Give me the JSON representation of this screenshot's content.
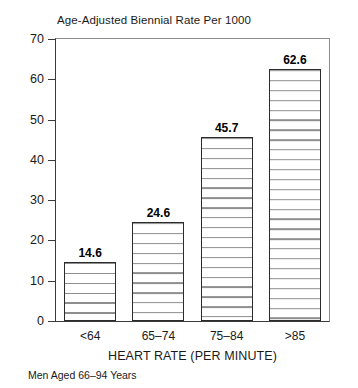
{
  "chart_data": {
    "type": "bar",
    "title": "Age-Adjusted Biennial Rate Per 1000",
    "xlabel": "HEART RATE (PER MINUTE)",
    "ylabel": "",
    "footnote": "Men Aged 66–94 Years",
    "categories": [
      "<64",
      "65–74",
      "75–84",
      ">85"
    ],
    "values": [
      14.6,
      24.6,
      45.7,
      62.6
    ],
    "value_labels": [
      "14.6",
      "24.6",
      "45.7",
      "62.6"
    ],
    "ylim": [
      0,
      70
    ],
    "ytick_step": 10,
    "yticks": [
      0,
      10,
      20,
      30,
      40,
      50,
      60,
      70
    ],
    "ytick_labels": [
      "0",
      "10",
      "20",
      "30",
      "40",
      "50",
      "60",
      "70"
    ],
    "grid": false,
    "legend": false,
    "bar_fill": "horizontal-hatch",
    "colors": {
      "bar_border": "#2b2b2b",
      "bar_hatch": "#8e8e8e",
      "bar_background": "#ffffff",
      "axis": "#3a3a3a",
      "frame": "#8d8d8d",
      "text": "#1a1a1a",
      "page_background": "#ffffff"
    }
  }
}
